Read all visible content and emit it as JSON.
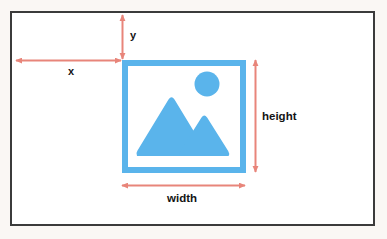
{
  "diagram": {
    "canvas": {
      "width": 387,
      "height": 239,
      "background_color": "#faf7f4",
      "frame_color": "#3b3b3b",
      "frame_fill": "#ffffff"
    },
    "image_box": {
      "name": "image-placeholder",
      "color": "#5ab4eb",
      "x": 122,
      "y": 60,
      "width": 124,
      "height": 113,
      "border_width": 6
    },
    "icon": {
      "name": "image-icon",
      "color": "#5ab4eb",
      "parts": [
        "sun-circle",
        "large-mountain",
        "small-mountain"
      ]
    },
    "measurements": [
      {
        "key": "x",
        "label": "x",
        "orientation": "horizontal",
        "description": "horizontal offset from left frame edge to image box"
      },
      {
        "key": "y",
        "label": "y",
        "orientation": "vertical",
        "description": "vertical offset from top frame edge to image box"
      },
      {
        "key": "height",
        "label": "height",
        "orientation": "vertical",
        "description": "height of the image box"
      },
      {
        "key": "width",
        "label": "width",
        "orientation": "horizontal",
        "description": "width of the image box"
      }
    ],
    "arrow_color": "#e8857a"
  }
}
